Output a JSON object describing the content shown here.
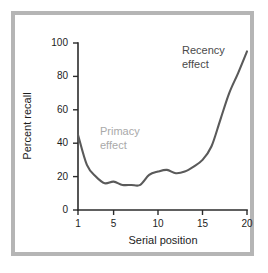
{
  "figure": {
    "frame_color": "#b5b5b5",
    "background_color": "#ffffff"
  },
  "axes": {
    "y_title": "Percent recall",
    "x_title": "Serial position",
    "y_ticks": [
      "0",
      "20",
      "40",
      "60",
      "80",
      "100"
    ],
    "x_ticks": [
      "1",
      "5",
      "10",
      "15",
      "20"
    ]
  },
  "annotations": {
    "recency": "Recency\neffect",
    "primacy": "Primacy\neffect"
  },
  "chart_data": {
    "type": "line",
    "title": "",
    "subtitle": "",
    "xlabel": "Serial position",
    "ylabel": "Percent recall",
    "xlim": [
      1,
      20
    ],
    "ylim": [
      0,
      100
    ],
    "xticks": [
      1,
      5,
      10,
      15,
      20
    ],
    "yticks": [
      0,
      20,
      40,
      60,
      80,
      100
    ],
    "grid": false,
    "legend": null,
    "line_color": "#5a5a5a",
    "x": [
      1,
      2,
      3,
      4,
      5,
      6,
      7,
      8,
      9,
      10,
      11,
      12,
      13,
      14,
      15,
      16,
      17,
      18,
      19,
      20
    ],
    "values": [
      45,
      27,
      20,
      16,
      17,
      15,
      15,
      15,
      21,
      23,
      24,
      22,
      23,
      26,
      30,
      38,
      54,
      70,
      82,
      95
    ],
    "annotations": [
      {
        "text": "Primacy effect",
        "x": 3,
        "y": 43,
        "color": "#a9a9a9"
      },
      {
        "text": "Recency effect",
        "x": 16,
        "y": 88,
        "color": "#4a4a4a"
      }
    ]
  }
}
